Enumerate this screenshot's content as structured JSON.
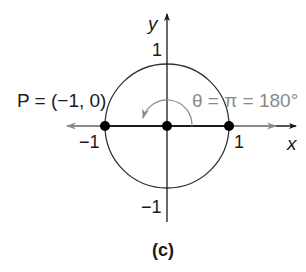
{
  "figure": {
    "caption": "(c)",
    "axes": {
      "x_label": "x",
      "y_label": "y"
    },
    "ticks": {
      "x_pos": "1",
      "x_neg": "−1",
      "y_pos": "1",
      "y_neg": "−1"
    },
    "point_label": "P = (−1, 0)",
    "angle_label": "θ = π = 180°",
    "colors": {
      "axis": "#1a1a1a",
      "circle": "#333333",
      "ray": "#8a8a8a",
      "angle_text": "#8a8a8a",
      "dot": "#000000"
    }
  }
}
